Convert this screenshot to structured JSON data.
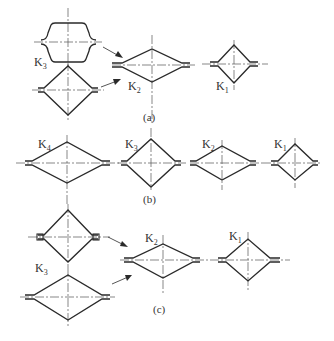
{
  "figure": {
    "panels": [
      {
        "id": "a",
        "caption": "(a)",
        "passes": [
          {
            "label": "K",
            "sub": "3",
            "shapes": [
              "barrel-oval",
              "square-diamond"
            ]
          },
          {
            "label": "K",
            "sub": "2",
            "shapes": [
              "flat-diamond"
            ]
          },
          {
            "label": "K",
            "sub": "1",
            "shapes": [
              "square-diamond"
            ]
          }
        ]
      },
      {
        "id": "b",
        "caption": "(b)",
        "passes": [
          {
            "label": "K",
            "sub": "4",
            "shapes": [
              "flat-diamond"
            ]
          },
          {
            "label": "K",
            "sub": "3",
            "shapes": [
              "square-diamond"
            ]
          },
          {
            "label": "K",
            "sub": "2",
            "shapes": [
              "flat-diamond"
            ]
          },
          {
            "label": "K",
            "sub": "1",
            "shapes": [
              "square-diamond"
            ]
          }
        ]
      },
      {
        "id": "c",
        "caption": "(c)",
        "passes": [
          {
            "label": "K",
            "sub": "3",
            "shapes": [
              "square-diamond",
              "flat-diamond"
            ]
          },
          {
            "label": "K",
            "sub": "2",
            "shapes": [
              "flat-diamond"
            ]
          },
          {
            "label": "K",
            "sub": "1",
            "shapes": [
              "square-diamond"
            ]
          }
        ]
      }
    ]
  },
  "labels": {
    "a_k3": "K",
    "a_k3_sub": "3",
    "a_k2": "K",
    "a_k2_sub": "2",
    "a_k1": "K",
    "a_k1_sub": "1",
    "b_k4": "K",
    "b_k4_sub": "4",
    "b_k3": "K",
    "b_k3_sub": "3",
    "b_k2": "K",
    "b_k2_sub": "2",
    "b_k1": "K",
    "b_k1_sub": "1",
    "c_k3": "K",
    "c_k3_sub": "3",
    "c_k2": "K",
    "c_k2_sub": "2",
    "c_k1": "K",
    "c_k1_sub": "1"
  },
  "captions": {
    "a": "(a)",
    "b": "(b)",
    "c": "(c)"
  },
  "colors": {
    "line": "#2a2a2a",
    "axis": "#555555",
    "background": "#ffffff"
  }
}
